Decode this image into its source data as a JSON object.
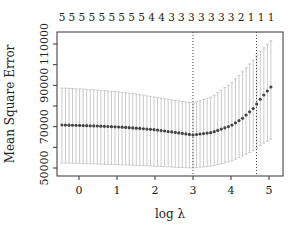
{
  "chart_data": {
    "type": "scatter",
    "title": "",
    "xlabel": "log λ",
    "ylabel": "Mean Square Error",
    "xlim": [
      -0.6,
      5.35
    ],
    "ylim": [
      46000,
      116000
    ],
    "xticks": [
      0,
      1,
      2,
      3,
      4,
      5
    ],
    "yticks": [
      50000,
      70000,
      90000,
      110000
    ],
    "ytick_labels_shown": [
      "50000",
      "70000",
      "90000",
      "110000"
    ],
    "grid": false,
    "top_axis_labels": [
      "5",
      "5",
      "5",
      "5",
      "5",
      "5",
      "5",
      "5",
      "5",
      "4",
      "4",
      "3",
      "3",
      "3",
      "3",
      "3",
      "3",
      "3",
      "2",
      "1",
      "1",
      "1"
    ],
    "top_axis_description": "number of nonzero coefficients",
    "vlines": [
      {
        "x": 3.0,
        "style": "dotted",
        "meaning": "lambda.min"
      },
      {
        "x": 4.67,
        "style": "dotted",
        "meaning": "lambda.1se"
      }
    ],
    "series": [
      {
        "name": "CV mean squared error",
        "x": [
          -0.45,
          0.0,
          0.5,
          1.0,
          1.5,
          2.0,
          2.5,
          3.0,
          3.5,
          4.0,
          4.3,
          4.6,
          4.8,
          5.05
        ],
        "values": [
          70800,
          70600,
          70300,
          69900,
          69300,
          68500,
          67300,
          66000,
          67200,
          70500,
          74000,
          79000,
          84000,
          89200
        ],
        "upper": [
          88700,
          88300,
          87700,
          86900,
          85800,
          84300,
          82800,
          81500,
          84500,
          91000,
          96500,
          102500,
          107000,
          111500
        ],
        "lower": [
          52400,
          52300,
          51900,
          51600,
          51300,
          50900,
          50400,
          50000,
          51000,
          53300,
          55800,
          58500,
          61300,
          64000
        ]
      }
    ],
    "colors": {
      "points": "#444444",
      "error_bars": "#bdbdbd",
      "frame": "#333333"
    }
  }
}
